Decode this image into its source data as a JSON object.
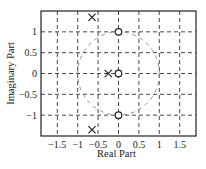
{
  "chart_data": {
    "type": "scatter",
    "title": "",
    "xlabel": "Real Part",
    "ylabel": "Imaginary Part",
    "xlim": [
      -1.9,
      1.9
    ],
    "ylim": [
      -1.5,
      1.5
    ],
    "xticks": [
      -1.5,
      -1,
      -0.5,
      0,
      0.5,
      1,
      1.5
    ],
    "xtick_labels": [
      "−1.5",
      "−1",
      "−0.5",
      "0",
      "0.5",
      "1",
      "1.5"
    ],
    "yticks": [
      1,
      0.5,
      0,
      -0.5,
      -1
    ],
    "ytick_labels": [
      "1",
      "0.5",
      "0",
      "−0.5",
      "−1"
    ],
    "grid": true,
    "legend": null,
    "unit_circle": {
      "center": [
        0,
        0
      ],
      "radius": 1,
      "style": "dashed",
      "color": "#888888"
    },
    "series": [
      {
        "name": "poles",
        "marker": "x",
        "points": [
          {
            "x": -0.65,
            "y": 1.35
          },
          {
            "x": -0.25,
            "y": 0
          },
          {
            "x": -0.65,
            "y": -1.35
          }
        ]
      },
      {
        "name": "zeros",
        "marker": "o",
        "points": [
          {
            "x": 0,
            "y": 1
          },
          {
            "x": 0,
            "y": 0
          },
          {
            "x": 0,
            "y": -1
          }
        ]
      }
    ]
  },
  "colors": {
    "axes": "#222222",
    "grid": "#333333",
    "circle": "#888888",
    "markers": "#222222"
  }
}
